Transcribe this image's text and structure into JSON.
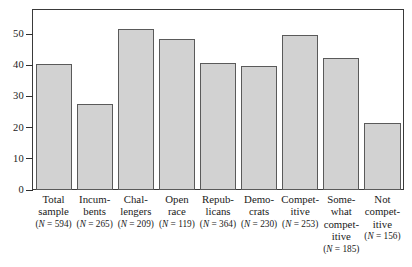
{
  "chart_data": {
    "type": "bar",
    "title": "",
    "subtitle": "",
    "xlabel": "",
    "ylabel": "",
    "ylim": [
      0,
      58
    ],
    "yticks": [
      0,
      10,
      20,
      30,
      40,
      50
    ],
    "ytick_labels": [
      "0",
      "10",
      "20",
      "30",
      "40",
      "50"
    ],
    "grid": false,
    "legend": "none",
    "bar_fill_color": "#d2d2d2",
    "bar_edge_color": "#5a5a5a",
    "frame_color": "#3a3a3a",
    "categories": [
      "Total sample",
      "Incumbents",
      "Challengers",
      "Open race",
      "Republicans",
      "Democrats",
      "Competitive",
      "Somewhat competitive",
      "Not competitive"
    ],
    "category_lines": [
      "Total\nsample",
      "Incum-\nbents",
      "Chal-\nlengers",
      "Open\nrace",
      "Repub-\nlicans",
      "Demo-\ncrats",
      "Compet-\nitive",
      "Some-\nwhat\ncompet-\nitive",
      "Not\ncompet-\nitive"
    ],
    "values": [
      40.5,
      27.8,
      52.0,
      48.8,
      40.8,
      39.8,
      49.8,
      42.4,
      21.7
    ],
    "n_values": [
      594,
      265,
      209,
      119,
      364,
      230,
      253,
      185,
      156
    ],
    "n_labels": [
      "(N = 594)",
      "(N = 265)",
      "(N = 209)",
      "(N = 119)",
      "(N = 364)",
      "(N = 230)",
      "(N = 253)",
      "(N = 185)",
      "(N = 156)"
    ]
  }
}
